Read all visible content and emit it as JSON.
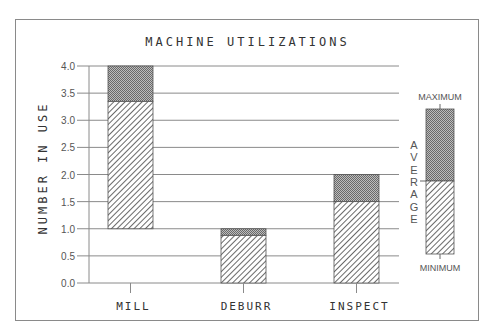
{
  "chart_data": {
    "type": "bar",
    "subtype": "floating-range-bar",
    "title": "MACHINE UTILIZATIONS",
    "xlabel": "",
    "ylabel": "NUMBER IN USE",
    "ylim": [
      0,
      4.0
    ],
    "yticks": [
      "0.0",
      "0.5",
      "1.0",
      "1.5",
      "2.0",
      "2.5",
      "3.0",
      "3.5",
      "4.0"
    ],
    "grid": true,
    "categories": [
      "MILL",
      "DEBURR",
      "INSPECT"
    ],
    "series": [
      {
        "name": "MINIMUM",
        "values": [
          1.0,
          0.0,
          0.0
        ]
      },
      {
        "name": "AVERAGE",
        "values": [
          3.35,
          0.88,
          1.5
        ]
      },
      {
        "name": "MAXIMUM",
        "values": [
          4.0,
          1.0,
          2.0
        ]
      }
    ],
    "legend": {
      "position": "right",
      "top_label": "MAXIMUM",
      "middle_label": "AVERAGE",
      "bottom_label": "MINIMUM"
    }
  },
  "colors": {
    "frame": "#8a8a8a",
    "grid": "#8a8a8a",
    "upper_fill": "#9a9a9a",
    "hatch": "#444444"
  }
}
